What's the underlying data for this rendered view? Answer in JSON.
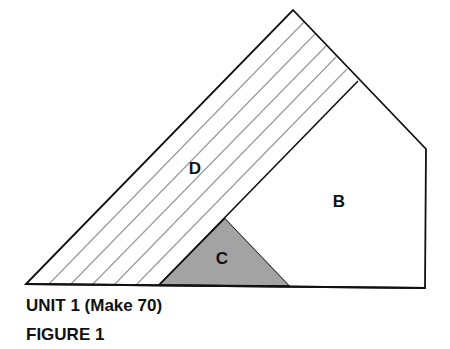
{
  "diagram": {
    "type": "quilt-block-piece-diagram",
    "colors": {
      "outline": "#111111",
      "stripe": "#9a9a9a",
      "piece_c_fill": "#a3a3a3",
      "background": "#ffffff"
    },
    "pieces": [
      {
        "id": "D",
        "label": "D",
        "fill": "striped",
        "label_x": 195,
        "label_y": 174
      },
      {
        "id": "B",
        "label": "B",
        "fill": "white",
        "label_x": 339,
        "label_y": 207
      },
      {
        "id": "C",
        "label": "C",
        "fill": "gray",
        "label_x": 222,
        "label_y": 262
      }
    ]
  },
  "caption": {
    "unit": "UNIT 1 (Make 70)",
    "figure": "FIGURE 1"
  }
}
